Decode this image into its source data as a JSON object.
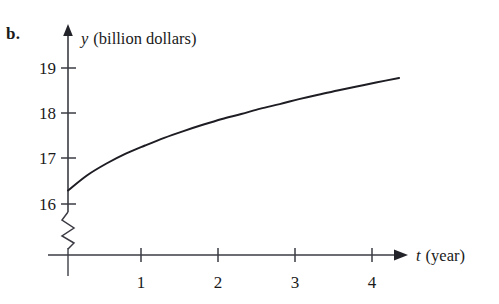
{
  "figure": {
    "part_label": "b."
  },
  "chart_data": {
    "type": "line",
    "title": "",
    "xlabel_var": "t",
    "xlabel_unit": "(year)",
    "ylabel_var": "y",
    "ylabel_unit": "(billion dollars)",
    "x_ticks": [
      1,
      2,
      3,
      4
    ],
    "x_tick_labels": [
      "1",
      "2",
      "3",
      "4"
    ],
    "y_ticks": [
      16,
      17,
      18,
      19
    ],
    "y_tick_labels": [
      "16",
      "17",
      "18",
      "19"
    ],
    "xlim": [
      0,
      4.45
    ],
    "ylim": [
      15.55,
      19.5
    ],
    "y_axis_break": true,
    "y_axis_break_note": "zigzag break below 16",
    "grid": false,
    "legend": false,
    "series": [
      {
        "name": "y",
        "x": [
          0,
          0.25,
          0.5,
          0.75,
          1,
          1.25,
          1.5,
          1.75,
          2,
          2.25,
          2.5,
          2.75,
          3,
          3.25,
          3.5,
          3.75,
          4
        ],
        "values": [
          16.3,
          16.63,
          16.88,
          17.09,
          17.28,
          17.44,
          17.58,
          17.71,
          17.83,
          17.95,
          18.05,
          18.15,
          18.25,
          18.34,
          18.43,
          18.51,
          18.6
        ]
      }
    ],
    "curve_points": [
      [
        0,
        16.3
      ],
      [
        0.25,
        16.64
      ],
      [
        0.5,
        16.9
      ],
      [
        0.75,
        17.12
      ],
      [
        1,
        17.3
      ],
      [
        1.25,
        17.47
      ],
      [
        1.5,
        17.62
      ],
      [
        1.75,
        17.76
      ],
      [
        2,
        17.89
      ],
      [
        2.25,
        18.0
      ],
      [
        2.5,
        18.12
      ],
      [
        2.75,
        18.22
      ],
      [
        3,
        18.33
      ],
      [
        3.25,
        18.43
      ],
      [
        3.5,
        18.52
      ],
      [
        3.75,
        18.61
      ],
      [
        4,
        18.7
      ],
      [
        4.3,
        18.8
      ]
    ],
    "colors": {
      "curve": "#1d1d23",
      "axis": "#3b3b44",
      "text": "#1a1a1a",
      "background": "#ffffff"
    }
  }
}
